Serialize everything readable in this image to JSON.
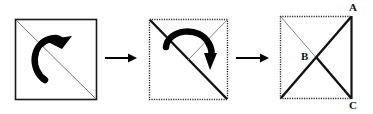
{
  "figure": {
    "background_color": "#ffffff",
    "stroke_color": "#1a1a1a",
    "thin_stroke_color": "#555555",
    "panels": [
      {
        "name": "panel-1-original-square",
        "square": {
          "x": 15,
          "y": 19,
          "size": 81,
          "border_style": "solid"
        },
        "diagonal": {
          "from": "top-left",
          "to": "bottom-right",
          "weight": "thin"
        },
        "arrow": {
          "name": "rotation-arrow-clockwise",
          "direction": "clockwise",
          "head": "up-right"
        }
      },
      {
        "name": "panel-2-folded-square",
        "square": {
          "x": 149,
          "y": 19,
          "size": 79,
          "border_style": "dotted"
        },
        "diagonal_thick": {
          "from": "top-left",
          "to": "bottom-right",
          "weight": "thick"
        },
        "diagonal_thin": {
          "from": "top-right",
          "to": "center",
          "weight": "thin"
        },
        "arrow": {
          "name": "rotation-arrow-clockwise",
          "direction": "clockwise",
          "head": "down"
        }
      },
      {
        "name": "panel-3-result-square",
        "square": {
          "x": 280,
          "y": 16,
          "size": 72,
          "border_style": "dotted-with-solid-right"
        },
        "diagonal_thick": {
          "from": "top-right",
          "to": "bottom-left",
          "weight": "thick"
        },
        "diagonal_thick_2": {
          "from": "center",
          "to": "bottom-right",
          "weight": "thick"
        },
        "diagonal_thin": {
          "from": "top-left",
          "to": "bottom-right",
          "weight": "thin"
        }
      }
    ],
    "transition_arrows": [
      {
        "name": "transition-arrow-1",
        "x1": 105,
        "y1": 58,
        "x2": 136,
        "y2": 58
      },
      {
        "name": "transition-arrow-2",
        "x1": 236,
        "y1": 58,
        "x2": 268,
        "y2": 58
      }
    ],
    "labels": [
      {
        "name": "vertex-label-a",
        "text": "A",
        "x": 349,
        "y": 2
      },
      {
        "name": "vertex-label-b",
        "text": "B",
        "x": 301,
        "y": 51
      },
      {
        "name": "vertex-label-c",
        "text": "C",
        "x": 349,
        "y": 100
      }
    ]
  }
}
